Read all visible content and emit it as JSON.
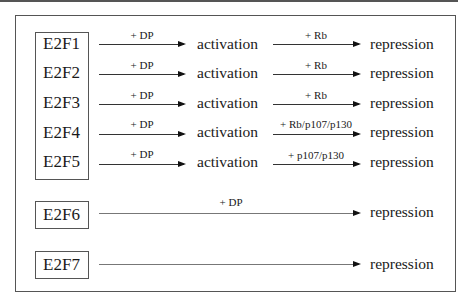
{
  "diagram": {
    "title": "",
    "rows": [
      {
        "gene": "E2F1",
        "step1_label": "+ DP",
        "step1_result": "activation",
        "step2_label": "+ Rb",
        "step2_result": "repression"
      },
      {
        "gene": "E2F2",
        "step1_label": "+ DP",
        "step1_result": "activation",
        "step2_label": "+ Rb",
        "step2_result": "repression"
      },
      {
        "gene": "E2F3",
        "step1_label": "+ DP",
        "step1_result": "activation",
        "step2_label": "+ Rb",
        "step2_result": "repression"
      },
      {
        "gene": "E2F4",
        "step1_label": "+ DP",
        "step1_result": "activation",
        "step2_label": "+ Rb/p107/p130",
        "step2_result": "repression"
      },
      {
        "gene": "E2F5",
        "step1_label": "+ DP",
        "step1_result": "activation",
        "step2_label": "+ p107/p130",
        "step2_result": "repression"
      },
      {
        "gene": "E2F6",
        "step_label": "+ DP",
        "result": "repression"
      },
      {
        "gene": "E2F7",
        "step_label": "",
        "result": "repression"
      }
    ]
  }
}
